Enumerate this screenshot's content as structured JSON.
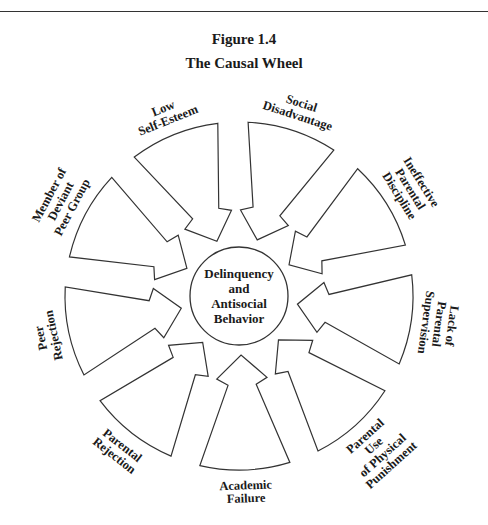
{
  "figure": {
    "number": "Figure 1.4",
    "title": "The Causal Wheel"
  },
  "hub": {
    "lines": [
      "Delinquency",
      "and",
      "Antisocial",
      "Behavior"
    ]
  },
  "geometry": {
    "cx": 239,
    "cy": 296,
    "outer_radius": 174,
    "hub_radius": 49,
    "label_radius": 196,
    "start_angle_deg": 208,
    "step_deg": 40
  },
  "causes": [
    {
      "id": "member-of-deviant-peer-group",
      "lines": [
        "Member of",
        "Deviant",
        "Peer Group"
      ]
    },
    {
      "id": "low-self-esteem",
      "lines": [
        "Low",
        "Self-Esteem"
      ]
    },
    {
      "id": "social-disadvantage",
      "lines": [
        "Social",
        "Disadvantage"
      ]
    },
    {
      "id": "ineffective-parental-discipline",
      "lines": [
        "Ineffective",
        "Parental",
        "Discipline"
      ]
    },
    {
      "id": "lack-of-parental-supervision",
      "lines": [
        "Lack of",
        "Parental",
        "Supervision"
      ]
    },
    {
      "id": "parental-use-of-physical-punishment",
      "lines": [
        "Parental",
        "Use",
        "of Physical",
        "Punishment"
      ]
    },
    {
      "id": "academic-failure",
      "lines": [
        "Academic",
        "Failure"
      ]
    },
    {
      "id": "parental-rejection",
      "lines": [
        "Parental",
        "Rejection"
      ]
    },
    {
      "id": "peer-rejection",
      "lines": [
        "Peer",
        "Rejection"
      ]
    }
  ],
  "colors": {
    "stroke": "#333333",
    "text": "#1a1a1a",
    "background": "#ffffff"
  }
}
